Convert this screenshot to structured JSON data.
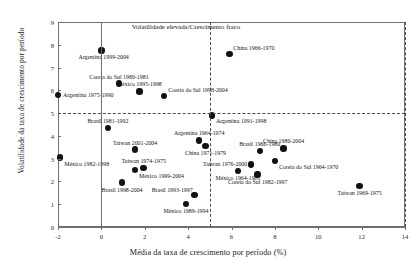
{
  "chart_data": {
    "type": "scatter",
    "title": "",
    "xlabel": "Média da taxa de crescimento por período (%)",
    "ylabel": "Volatilidade da taxa de crescimento por período",
    "xlim": [
      -2,
      14
    ],
    "ylim": [
      0,
      9
    ],
    "xticks": [
      -2,
      0,
      2,
      4,
      6,
      8,
      10,
      12,
      14
    ],
    "yticks": [
      0,
      1,
      2,
      3,
      4,
      5,
      6,
      7,
      8,
      9
    ],
    "grid": false,
    "legend": "none",
    "reference_lines": [
      {
        "axis": "x",
        "value": 5,
        "style": "dashed"
      },
      {
        "axis": "y",
        "value": 5,
        "style": "dashed"
      }
    ],
    "annotations": [
      {
        "text": "Volatilidade elevada/Crescimento fraco",
        "x": 1.4,
        "y": 8.8
      }
    ],
    "points": [
      {
        "label": "Argentina 1999-2004",
        "x": 0.0,
        "y": 7.75,
        "label_pos": "below-left"
      },
      {
        "label": "China 1966-1970",
        "x": 5.9,
        "y": 7.6,
        "label_pos": "above-right"
      },
      {
        "label": "Coreia do Sul 1980-1981",
        "x": 0.8,
        "y": 6.3,
        "label_pos": "above"
      },
      {
        "label": "México 1995-1998",
        "x": 1.75,
        "y": 5.95,
        "label_pos": "above"
      },
      {
        "label": "Argentina 1975-1990",
        "x": -2.0,
        "y": 5.8,
        "label_pos": "right"
      },
      {
        "label": "Coreia do Sul 1998-2004",
        "x": 2.9,
        "y": 5.75,
        "label_pos": "above-right"
      },
      {
        "label": "Brasil 1981-1992",
        "x": 0.3,
        "y": 4.35,
        "label_pos": "above"
      },
      {
        "label": "Argentina 1991-1998",
        "x": 5.1,
        "y": 4.9,
        "label_pos": "below-right"
      },
      {
        "label": "Argentina 1964-1974",
        "x": 4.5,
        "y": 3.8,
        "label_pos": "above"
      },
      {
        "label": "China 1971-1979",
        "x": 4.8,
        "y": 3.55,
        "label_pos": "below"
      },
      {
        "label": "Brasil 1966-1980",
        "x": 7.3,
        "y": 3.35,
        "label_pos": "above"
      },
      {
        "label": "China 1980-2004",
        "x": 8.4,
        "y": 3.45,
        "label_pos": "above"
      },
      {
        "label": "Taiwan 2001-2004",
        "x": 1.55,
        "y": 3.4,
        "label_pos": "above"
      },
      {
        "label": "México 1982-1998",
        "x": -1.9,
        "y": 3.05,
        "label_pos": "below-right"
      },
      {
        "label": "Coreia do Sul 1964-1970",
        "x": 8.0,
        "y": 2.9,
        "label_pos": "below-right"
      },
      {
        "label": "Taiwan 1976-2000",
        "x": 6.9,
        "y": 2.75,
        "label_pos": "left"
      },
      {
        "label": "Taiwan 1974-1975",
        "x": 1.95,
        "y": 2.6,
        "label_pos": "above"
      },
      {
        "label": "México 1999-2004",
        "x": 1.55,
        "y": 2.5,
        "label_pos": "below-right"
      },
      {
        "label": "México 1964-1981",
        "x": 6.3,
        "y": 2.45,
        "label_pos": "below"
      },
      {
        "label": "Coreia do Sul 1982-1997",
        "x": 7.2,
        "y": 2.3,
        "label_pos": "below"
      },
      {
        "label": "Brasil 1998-2004",
        "x": 0.95,
        "y": 1.95,
        "label_pos": "below"
      },
      {
        "label": "Taiwan 1969-1975",
        "x": 11.9,
        "y": 1.8,
        "label_pos": "below"
      },
      {
        "label": "Brasil 1993-1997",
        "x": 4.3,
        "y": 1.4,
        "label_pos": "above-left"
      },
      {
        "label": "México 1989-1994",
        "x": 3.9,
        "y": 1.0,
        "label_pos": "below"
      }
    ]
  }
}
